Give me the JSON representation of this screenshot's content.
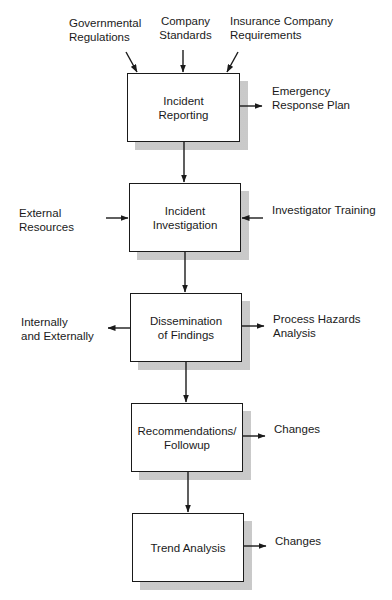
{
  "diagram": {
    "type": "flowchart",
    "direction": "top-to-bottom",
    "colors": {
      "stroke": "#1a1a1a",
      "box_fill": "#ffffff",
      "shadow": "#d4d4d4",
      "background": "#ffffff"
    },
    "top_inputs": [
      {
        "id": "governmental-regulations",
        "label": "Governmental\nRegulations"
      },
      {
        "id": "company-standards",
        "label": "Company\nStandards"
      },
      {
        "id": "insurance-company-requirements",
        "label": "Insurance Company\nRequirements"
      }
    ],
    "steps": [
      {
        "id": "incident-reporting",
        "label": "Incident\nReporting",
        "left_input": null,
        "left_output": null,
        "right_input": null,
        "right_output": "Emergency\nResponse Plan"
      },
      {
        "id": "incident-investigation",
        "label": "Incident\nInvestigation",
        "left_input": "External\nResources",
        "left_output": null,
        "right_input": "Investigator Training",
        "right_output": null
      },
      {
        "id": "dissemination-of-findings",
        "label": "Dissemination\nof Findings",
        "left_input": null,
        "left_output": "Internally\nand Externally",
        "right_input": null,
        "right_output": "Process Hazards\nAnalysis"
      },
      {
        "id": "recommendations-followup",
        "label": "Recommendations/\nFollowup",
        "left_input": null,
        "left_output": null,
        "right_input": null,
        "right_output": "Changes"
      },
      {
        "id": "trend-analysis",
        "label": "Trend Analysis",
        "left_input": null,
        "left_output": null,
        "right_input": null,
        "right_output": "Changes"
      }
    ]
  }
}
